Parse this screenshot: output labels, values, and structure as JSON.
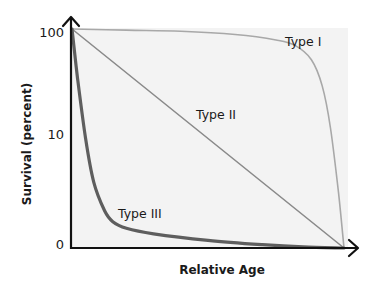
{
  "chart_data": {
    "type": "line",
    "title": "",
    "xlabel": "Relative Age",
    "ylabel": "Survival (percent)",
    "x_range": [
      0,
      1
    ],
    "y_ticks": [
      {
        "label": "100",
        "value": 1.0
      },
      {
        "label": "10",
        "value": 0.5
      },
      {
        "label": "0",
        "value": 0.0
      }
    ],
    "y_scale_note": "logarithmic-style survival axis; values normalized 0 (bottom) to 1 (top)",
    "grid": false,
    "legend": "inline labels",
    "series": [
      {
        "name": "Type I",
        "label_position": "top-right",
        "color": "#a8a8a8",
        "x": [
          0.0,
          0.2,
          0.4,
          0.6,
          0.75,
          0.82,
          0.88,
          0.92,
          0.95,
          0.98,
          1.0
        ],
        "y": [
          1.0,
          0.995,
          0.99,
          0.975,
          0.95,
          0.925,
          0.86,
          0.74,
          0.55,
          0.25,
          0.0
        ]
      },
      {
        "name": "Type II",
        "label_position": "center",
        "color": "#8a8a8a",
        "x": [
          0.0,
          1.0
        ],
        "y": [
          1.0,
          0.0
        ]
      },
      {
        "name": "Type III",
        "label_position": "bottom-left",
        "color": "#5e5e5e",
        "x": [
          0.0,
          0.02,
          0.05,
          0.08,
          0.12,
          0.15,
          0.2,
          0.3,
          0.5,
          0.7,
          0.85,
          1.0
        ],
        "y": [
          1.0,
          0.78,
          0.5,
          0.3,
          0.17,
          0.12,
          0.09,
          0.065,
          0.035,
          0.015,
          0.005,
          0.0
        ]
      }
    ]
  }
}
